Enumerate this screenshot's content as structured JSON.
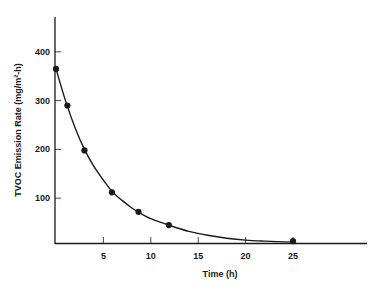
{
  "chart_data": {
    "type": "line",
    "title": "",
    "xlabel": "Time (h)",
    "ylabel": "TVOC Emission Rate (mg/m²-h)",
    "xlim": [
      0,
      31
    ],
    "ylim": [
      0,
      470
    ],
    "x_ticks": [
      5,
      10,
      15,
      20,
      25
    ],
    "y_ticks": [
      100,
      200,
      300,
      400
    ],
    "grid": false,
    "legend": null,
    "series": [
      {
        "name": "TVOC emission (measured)",
        "style": "markers",
        "x": [
          0,
          1.2,
          3,
          5.9,
          8.7,
          11.9,
          25
        ],
        "y": [
          365,
          290,
          198,
          112,
          72,
          45,
          12
        ]
      },
      {
        "name": "Fitted decay curve",
        "style": "smooth-line",
        "x": [
          0,
          1,
          2,
          3,
          4,
          5,
          6,
          7,
          8,
          9,
          10,
          12,
          14,
          16,
          18,
          20,
          22,
          25
        ],
        "y": [
          365,
          300,
          245,
          200,
          165,
          137,
          112,
          95,
          80,
          68,
          58,
          44,
          32,
          24,
          18,
          14,
          12,
          10
        ]
      }
    ]
  }
}
